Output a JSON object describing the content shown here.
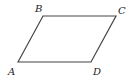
{
  "diagram": {
    "shape": "parallelogram",
    "stroke_color": "#444444",
    "stroke_width": 1.2,
    "vertices": [
      {
        "label": "A",
        "x": 18,
        "y": 62,
        "label_x": 8,
        "label_y": 67
      },
      {
        "label": "B",
        "x": 43,
        "y": 16,
        "label_x": 35,
        "label_y": 4
      },
      {
        "label": "C",
        "x": 116,
        "y": 16,
        "label_x": 118,
        "label_y": 6
      },
      {
        "label": "D",
        "x": 91,
        "y": 62,
        "label_x": 93,
        "label_y": 67
      }
    ]
  }
}
